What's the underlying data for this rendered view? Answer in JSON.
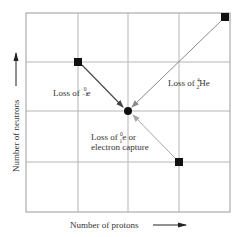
{
  "diagram": {
    "x_axis_label": "Number of protons",
    "y_axis_label": "Number of neutrons",
    "colors": {
      "grid": "#b5b5b5",
      "frame": "#9a9a9a",
      "marker": "#111111",
      "arrow_beta_minus": "#444444",
      "arrow_alpha": "#8a8a8a",
      "arrow_beta_plus": "#a8a8a8",
      "text": "#333333"
    },
    "nodes": [
      {
        "id": "parent-beta-minus",
        "shape": "square",
        "grid": [
          1,
          3
        ]
      },
      {
        "id": "parent-alpha",
        "shape": "square",
        "grid": [
          4,
          4
        ]
      },
      {
        "id": "daughter",
        "shape": "circle",
        "grid": [
          2,
          2
        ]
      },
      {
        "id": "parent-beta-plus",
        "shape": "square",
        "grid": [
          3,
          1
        ]
      }
    ],
    "transitions": [
      {
        "id": "beta-minus",
        "prefix": "Loss of ",
        "sup": "0",
        "sub": "−1",
        "symbol": "e",
        "suffix": ""
      },
      {
        "id": "alpha",
        "prefix": "Loss of ",
        "sup": "4",
        "sub": "2",
        "symbol": "He",
        "suffix": ""
      },
      {
        "id": "beta-plus",
        "prefix": "Loss of ",
        "sup": "0",
        "sub": "1",
        "symbol": "e",
        "suffix": " or",
        "line2": "electron capture"
      }
    ]
  }
}
